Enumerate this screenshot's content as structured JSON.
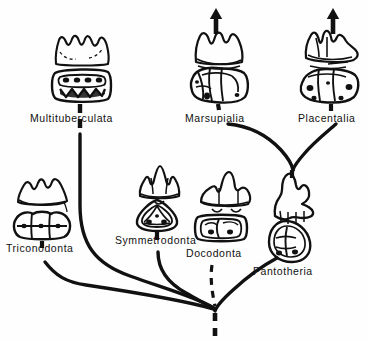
{
  "figure": {
    "type": "phylogenetic-tree",
    "background_color": "#fefefe",
    "line_color": "#111111",
    "root": {
      "x": 215,
      "y": 311,
      "dashed_stem": true
    }
  },
  "taxa": [
    {
      "id": "multituberculata",
      "label": "Multituberculata",
      "label_x": 30,
      "label_y": 113,
      "crown_x": 82,
      "crown_y": 48,
      "occlusal_x": 82,
      "occlusal_y": 85,
      "connector": "dashed",
      "terminal_arrow": false,
      "branch_origin_x": 80,
      "branch_origin_y": 134
    },
    {
      "id": "marsupialia",
      "label": "Marsupialia",
      "label_x": 185,
      "label_y": 118,
      "crown_x": 220,
      "crown_y": 48,
      "occlusal_x": 220,
      "occlusal_y": 85,
      "connector": "solid",
      "terminal_arrow": true,
      "arrow_x": 216,
      "arrow_y": 8,
      "branch_origin_x": 228,
      "branch_origin_y": 124
    },
    {
      "id": "placentalia",
      "label": "Placentalia",
      "label_x": 298,
      "label_y": 118,
      "crown_x": 330,
      "crown_y": 48,
      "occlusal_x": 330,
      "occlusal_y": 85,
      "connector": "solid",
      "terminal_arrow": true,
      "arrow_x": 333,
      "arrow_y": 8,
      "branch_origin_x": 336,
      "branch_origin_y": 124
    },
    {
      "id": "triconodonta",
      "label": "Triconodonta",
      "label_x": 6,
      "label_y": 248,
      "crown_x": 44,
      "crown_y": 190,
      "occlusal_x": 42,
      "occlusal_y": 225,
      "connector": "dashed",
      "terminal_arrow": false,
      "branch_origin_x": 45,
      "branch_origin_y": 262
    },
    {
      "id": "symmetrodonta",
      "label": "Symmetrodonta",
      "label_x": 115,
      "label_y": 240,
      "crown_x": 159,
      "crown_y": 180,
      "occlusal_x": 157,
      "occlusal_y": 215,
      "connector": "dashed",
      "terminal_arrow": false,
      "branch_origin_x": 158,
      "branch_origin_y": 252
    },
    {
      "id": "docodonta",
      "label": "Docodonta",
      "label_x": 186,
      "label_y": 253,
      "crown_x": 225,
      "crown_y": 190,
      "occlusal_x": 221,
      "occlusal_y": 228,
      "connector": "dashed",
      "terminal_arrow": false,
      "branch_origin_x": 212,
      "branch_origin_y": 265
    },
    {
      "id": "pantotheria",
      "label": "Pantotheria",
      "label_x": 253,
      "label_y": 271,
      "crown_x": 293,
      "crown_y": 196,
      "occlusal_x": 290,
      "occlusal_y": 240,
      "connector": "solid",
      "terminal_arrow": false,
      "branch_origin_x": 277,
      "branch_origin_y": 258
    }
  ],
  "branches": [
    {
      "id": "branch-multituberculata",
      "from": "multituberculata",
      "to": "root",
      "style": "solid"
    },
    {
      "id": "branch-triconodonta",
      "from": "triconodonta",
      "to": "root",
      "style": "solid"
    },
    {
      "id": "branch-symmetrodonta",
      "from": "symmetrodonta",
      "to": "root",
      "style": "solid"
    },
    {
      "id": "branch-docodonta",
      "from": "docodonta",
      "to": "root",
      "style": "dashed"
    },
    {
      "id": "branch-pantotheria",
      "from": "pantotheria",
      "to": "root",
      "style": "solid"
    },
    {
      "id": "branch-marsupialia",
      "from": "marsupialia",
      "to": "pantotheria-node",
      "style": "solid"
    },
    {
      "id": "branch-placentalia",
      "from": "placentalia",
      "to": "pantotheria-node",
      "style": "solid"
    }
  ]
}
